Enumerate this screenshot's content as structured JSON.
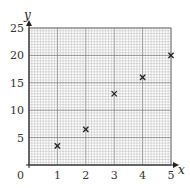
{
  "chart_data": {
    "type": "scatter",
    "title": "",
    "xlabel": "x",
    "ylabel": "y",
    "xlim": [
      0,
      5
    ],
    "ylim": [
      0,
      25
    ],
    "x_ticks": [
      0,
      1,
      2,
      3,
      4,
      5
    ],
    "y_ticks": [
      5,
      10,
      15,
      20,
      25
    ],
    "x_tick_labels": [
      "0",
      "1",
      "2",
      "3",
      "4",
      "5"
    ],
    "y_tick_labels": [
      "5",
      "10",
      "15",
      "20",
      "25"
    ],
    "origin_label": "0",
    "grid": true,
    "grid_style": "graph paper (fine minor grid, major lines every 5 units on y and 1 unit on x)",
    "marker": "x",
    "legend": null,
    "series": [
      {
        "name": "points",
        "x": [
          1,
          2,
          3,
          4,
          5
        ],
        "y": [
          3.5,
          6.5,
          13,
          16,
          20
        ]
      }
    ]
  },
  "colors": {
    "grid_minor": "#b8b8b8",
    "grid_major": "#7a7a7a",
    "axis": "#222222",
    "marker": "#222222"
  }
}
